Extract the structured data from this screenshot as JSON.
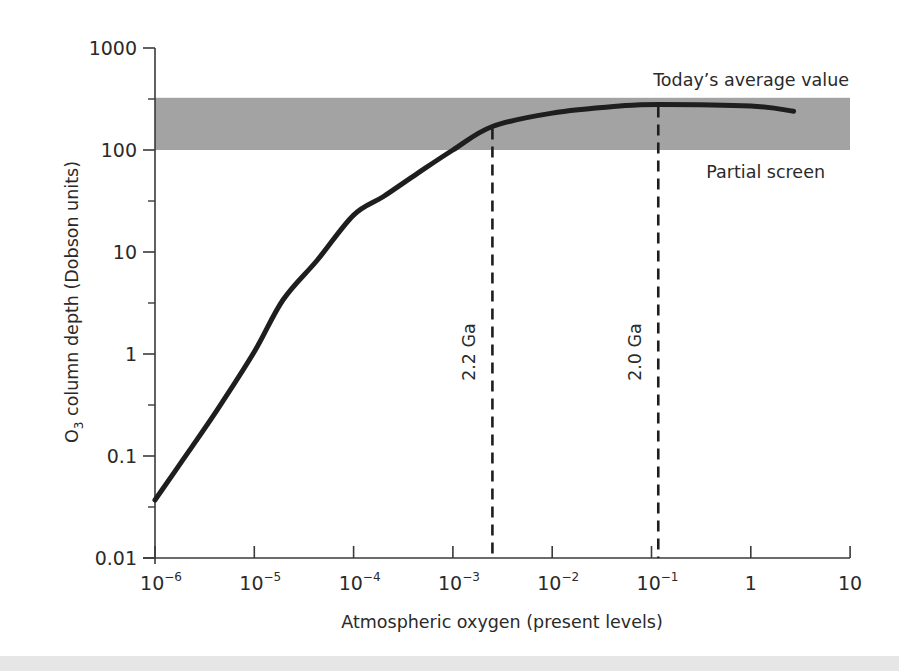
{
  "chart_data": {
    "type": "line",
    "title": "",
    "xlabel": "Atmospheric oxygen (present levels)",
    "ylabel": "O3 column depth (Dobson units)",
    "xscale": "log",
    "yscale": "log",
    "xlim": [
      1e-06,
      10
    ],
    "ylim": [
      0.01,
      1000
    ],
    "grid": false,
    "x_ticks": [
      {
        "base": "10",
        "exp": "−6",
        "value": 1e-06
      },
      {
        "base": "10",
        "exp": "−5",
        "value": 1e-05
      },
      {
        "base": "10",
        "exp": "−4",
        "value": 0.0001
      },
      {
        "base": "10",
        "exp": "−3",
        "value": 0.001
      },
      {
        "base": "10",
        "exp": "−2",
        "value": 0.01
      },
      {
        "base": "10",
        "exp": "−1",
        "value": 0.1
      },
      {
        "base": "1",
        "exp": "",
        "value": 1
      },
      {
        "base": "10",
        "exp": "",
        "value": 10
      }
    ],
    "y_ticks": [
      {
        "label": "1000",
        "value": 1000
      },
      {
        "label": "100",
        "value": 100
      },
      {
        "label": "10",
        "value": 10
      },
      {
        "label": "1",
        "value": 1
      },
      {
        "label": "0.1",
        "value": 0.1
      },
      {
        "label": "0.01",
        "value": 0.01
      }
    ],
    "series": [
      {
        "name": "O3 column depth",
        "color": "#1e1e1e",
        "x": [
          1e-06,
          1.9e-06,
          4.2e-06,
          1e-05,
          1.95e-05,
          4.3e-05,
          0.0001,
          0.0002,
          0.00044,
          0.001,
          0.0025,
          0.01,
          0.048,
          0.117,
          1,
          2.7
        ],
        "y": [
          0.037,
          0.091,
          0.28,
          1.05,
          3.4,
          8.3,
          23,
          35,
          59,
          100,
          170,
          230,
          270,
          280,
          270,
          240
        ]
      }
    ],
    "bands": [
      {
        "label_top": "Today’s average value",
        "label_bottom": "Partial screen",
        "y_from": 100,
        "y_to": 325,
        "color": "#a3a3a3"
      }
    ],
    "vlines": [
      {
        "label": "2.2 Ga",
        "x": 0.0025,
        "style": "dashed"
      },
      {
        "label": "2.0 Ga",
        "x": 0.117,
        "style": "dashed"
      }
    ],
    "annotations": [
      "Today’s average value",
      "Partial screen",
      "2.2 Ga",
      "2.0 Ga"
    ]
  },
  "labels": {
    "ylabel_o": "O",
    "ylabel_sub": "3",
    "ylabel_rest": " column depth (Dobson units)",
    "xlabel": "Atmospheric oxygen (present levels)",
    "band_top": "Today’s average value",
    "band_bottom": "Partial screen",
    "vline1": "2.2 Ga",
    "vline2": "2.0 Ga"
  }
}
